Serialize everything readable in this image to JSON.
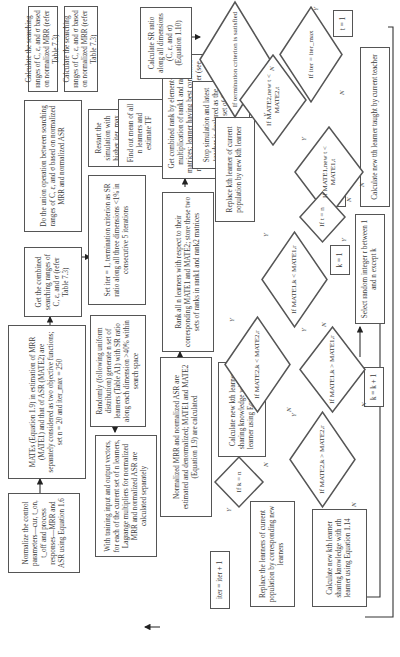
{
  "flowchart": {
    "orientation": "rotated-90-ccw",
    "boxes": {
      "normalize": "Normalize the control parameters—cur, t_on, t_off and process responses—MRR and ASR using Equation 1.6",
      "mates": "MATEs (Equation 1.9) in estimation of MRR (MATE1) and that of ASR (MATE2) are separately considered as two objective functions; set n = 20 and iter_max = 250",
      "combined_ranges": "Get the combined searching ranges of C, ε, and σ (refer Table 7.3)",
      "union": "Do the union operation between searching ranges of C, ε, and σ based on normalized MRR and normalized ASR",
      "calc_range_mrr": "Calculate the searching ranges of C, ε, and σ based on normalized MRR (refer Table 7.3)",
      "calc_range_asr": "Calculate the searching ranges of C, ε, and σ based on normalized MRR (refer Table 7.3)",
      "set_iter": "Set iter = 1, termination criterion as SR ratio along all three dimensions <1% in consecutive 5 iterations",
      "restart": "Restart the simulation with higher iter_max",
      "randomly": "Randomly (following uniform distribution) generate n set of learners (Table A1) with SR ratio along each dimension >40% within search space",
      "training": "With training input and output vectors, for each of the current set of n learners, Lagrange multipliers for normalized MRR and normalized ASR are calculated separately",
      "normalized_mrr": "Normalized MRR and normalized ASR are estimated and denormalized; MATE1 and MATE2 (Equation 1.9) are calculated",
      "rank_all": "Rank all n learners with respect to their corresponding MATE1 and MATE2; store these two sets of ranks in rank1 and rank2 matrices",
      "combined_rank": "Get combined rank by element-wise multiplication of rank1 and rank2 matrices; learner having best combined rank is selected as current teacher (see step 5)",
      "find_mean": "Find out mean of all n learners and estimate TF",
      "calc_sr": "Calculate SR ratio along all dimensions (C, ε, and σ) (Equation 1.10)",
      "stop_sim": "Stop simulation and latest teacher is declared as the optimum unique set of C, ε, and σ",
      "replace_kth": "Replace kth learner of current population by new kth learner",
      "calc_new_kth_113": "Calculate new kth learner sharing knowledge with rth learner using Equation 1.13",
      "calc_new_kth_114": "Calculate new kth learner sharing knowledge with rth learner using Equation 1.14",
      "replace_learners": "Replace the learners of current population by corresponding new learners",
      "iter_inc": "iter = iter + 1",
      "t_eq_1": "t = 1",
      "calc_taught": "Calculate new tth learner taught by current teacher",
      "t_inc": "t = t + 1",
      "k_eq_1": "k = 1",
      "select_random": "Select random integer r between 1 and n except k",
      "k_inc": "k = k + 1"
    },
    "decisions": {
      "termination": "If termination criterion is satisfied",
      "iter_max": "If iter = iter_max",
      "mate1_new_t": "If MATE1,new t < MATE1,t",
      "mate2_new_t": "If MATE2,new t < MATE2,t",
      "t_eq_n": "If t = n",
      "mate1_k_lt_r": "If MATE1,k < MATE1,r",
      "mate2_k_lt_r": "If MATE2,k < MATE2,r",
      "mate1_k_gt_r": "If MATE1,k > MATE1,r",
      "mate2_k_gt_r": "If MATE2,k > MATE2,r",
      "k_eq_n": "If k = n"
    },
    "labels": {
      "yes": "Y",
      "no": "N"
    }
  }
}
